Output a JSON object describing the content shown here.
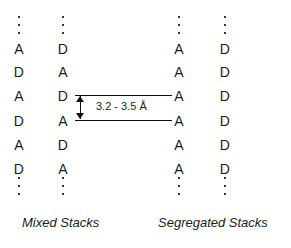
{
  "figure": {
    "title_absent": true,
    "background_color": "#ffffff",
    "ink_color": "#1c1c1c"
  },
  "stacks": [
    {
      "group": "mixed",
      "column_index": 1,
      "ellipsis_top": [
        "dot",
        "dot",
        "dot"
      ],
      "sites": [
        "A",
        "D",
        "A",
        "D",
        "A",
        "D"
      ],
      "ellipsis_bottom": [
        "dot",
        "dot",
        "dot"
      ]
    },
    {
      "group": "mixed",
      "column_index": 2,
      "ellipsis_top": [
        "dot",
        "dot",
        "dot"
      ],
      "sites": [
        "D",
        "A",
        "D",
        "A",
        "D",
        "A"
      ],
      "ellipsis_bottom": [
        "dot",
        "dot",
        "dot"
      ]
    },
    {
      "group": "segregated",
      "column_index": 3,
      "ellipsis_top": [
        "dot",
        "dot",
        "dot"
      ],
      "sites": [
        "A",
        "A",
        "A",
        "A",
        "A",
        "A"
      ],
      "ellipsis_bottom": [
        "dot",
        "dot",
        "dot"
      ]
    },
    {
      "group": "segregated",
      "column_index": 4,
      "ellipsis_top": [
        "dot",
        "dot",
        "dot"
      ],
      "sites": [
        "D",
        "D",
        "D",
        "D",
        "D",
        "D"
      ],
      "ellipsis_bottom": [
        "dot",
        "dot",
        "dot"
      ]
    }
  ],
  "annotation": {
    "spacing_label": "3.2 - 3.5 Å",
    "arrow_type": "double-headed-vertical",
    "guide_lines": 2,
    "measures_between_rows": [
      3,
      4
    ]
  },
  "captions": {
    "mixed": "Mixed Stacks",
    "segregated": "Segregated Stacks"
  },
  "legend_keys": {
    "A": "A",
    "D": "D"
  }
}
